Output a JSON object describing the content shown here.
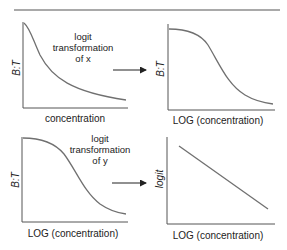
{
  "colors": {
    "axis": "#555555",
    "curve": "#707070",
    "text": "#222222",
    "rule": "#555555"
  },
  "panels": [
    {
      "id": "top-left",
      "y_label": "B:T",
      "x_label": "concentration",
      "curve": "exponential-decay"
    },
    {
      "id": "top-right",
      "y_label": "B:T",
      "x_label": "LOG (concentration)",
      "curve": "sigmoid-decreasing"
    },
    {
      "id": "bottom-left",
      "y_label": "B:T",
      "x_label": "LOG (concentration)",
      "curve": "sigmoid-decreasing"
    },
    {
      "id": "bottom-right",
      "y_label": "logit",
      "x_label": "LOG (concentration)",
      "curve": "straight-line-decreasing"
    }
  ],
  "transforms": [
    {
      "line1": "logit",
      "line2": "transformation",
      "line3": "of x"
    },
    {
      "line1": "logit",
      "line2": "transformation",
      "line3": "of y"
    }
  ]
}
